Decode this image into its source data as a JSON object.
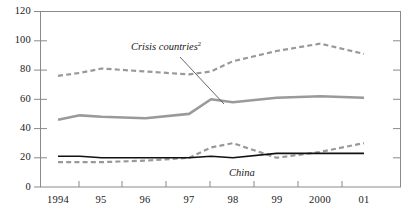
{
  "chart_data": {
    "type": "line",
    "title": "",
    "subtitle": "",
    "xlabel": "",
    "ylabel": "",
    "ylim": [
      0,
      120
    ],
    "yticks": [
      0,
      20,
      40,
      60,
      80,
      100,
      120
    ],
    "grid": false,
    "legend_position": "inline-annotations",
    "categories": [
      "1994",
      "95",
      "96",
      "97",
      "98",
      "99",
      "2000",
      "01"
    ],
    "x_tick_labels": [
      "1994",
      "95",
      "96",
      "97",
      "98",
      "99",
      "2000",
      "01"
    ],
    "x": [
      1994,
      1994.5,
      1995,
      1996,
      1997,
      1997.5,
      1998,
      1999,
      2000,
      2001
    ],
    "series": [
      {
        "name": "Crisis countries upper (dashed)",
        "style": "dashed",
        "color": "#999999",
        "x": [
          1994,
          1994.5,
          1995,
          1996,
          1997,
          1997.5,
          1998,
          1999,
          2000,
          2001
        ],
        "values": [
          76,
          78,
          81,
          79,
          77,
          79,
          86,
          93,
          98,
          91
        ]
      },
      {
        "name": "Crisis countries",
        "style": "solid",
        "color": "#9a9a9a",
        "x": [
          1994,
          1994.5,
          1995,
          1996,
          1997,
          1997.5,
          1998,
          1999,
          2000,
          2001
        ],
        "values": [
          46,
          49,
          48,
          47,
          50,
          60,
          58,
          61,
          62,
          61
        ]
      },
      {
        "name": "China lower (dashed)",
        "style": "dashed",
        "color": "#999999",
        "x": [
          1994,
          1994.5,
          1995,
          1996,
          1997,
          1997.5,
          1998,
          1999,
          2000,
          2001
        ],
        "values": [
          17,
          17,
          17,
          18,
          20,
          27,
          30,
          20,
          24,
          30
        ]
      },
      {
        "name": "China",
        "style": "solid",
        "color": "#111111",
        "x": [
          1994,
          1994.5,
          1995,
          1996,
          1997,
          1997.5,
          1998,
          1999,
          2000,
          2001
        ],
        "values": [
          21,
          21,
          20,
          20,
          20,
          21,
          20,
          23,
          23,
          23
        ]
      }
    ],
    "annotations": [
      {
        "text": "Crisis countries",
        "superscript": "2",
        "style": "italic",
        "leader_line": true
      },
      {
        "text": "China",
        "superscript": "",
        "style": "italic",
        "leader_line": false
      }
    ]
  },
  "axis": {
    "y_tick_0": "0",
    "y_tick_20": "20",
    "y_tick_40": "40",
    "y_tick_60": "60",
    "y_tick_80": "80",
    "y_tick_100": "100",
    "y_tick_120": "120",
    "x_tick_1994": "1994",
    "x_tick_95": "95",
    "x_tick_96": "96",
    "x_tick_97": "97",
    "x_tick_98": "98",
    "x_tick_99": "99",
    "x_tick_2000": "2000",
    "x_tick_01": "01"
  },
  "labels": {
    "crisis_countries": "Crisis countries",
    "crisis_countries_footnote": "2",
    "china": "China"
  },
  "colors": {
    "frame": "#8a8a8a",
    "gray_series": "#9a9a9a",
    "black_series": "#111111",
    "text": "#1a1a1a",
    "background": "#ffffff"
  }
}
